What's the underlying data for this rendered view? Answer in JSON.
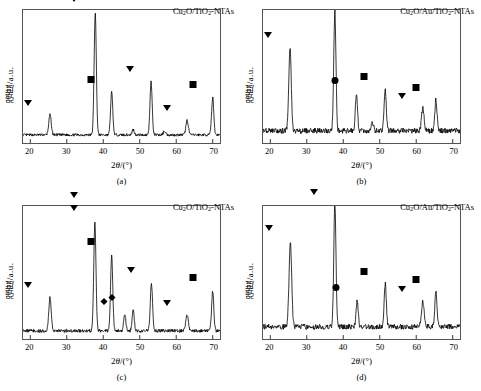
{
  "figure": {
    "axis": {
      "ylabel": "强度/a.u.",
      "xlabel_prefix": "2",
      "xlabel_theta": "θ",
      "xlabel_suffix": "/(°)",
      "xticks": [
        20,
        30,
        40,
        50,
        60,
        70
      ],
      "xlim": [
        18,
        72
      ]
    },
    "panels": [
      {
        "caption": "(a)",
        "label_parts": [
          "Cu",
          "2",
          "O/TiO",
          "2",
          "-NTAs"
        ],
        "label_text": "Cu2O/TiO2-NTAs"
      },
      {
        "caption": "(b)",
        "label_parts": [
          "Cu",
          "2",
          "O/Au/TiO",
          "2",
          "-NTAs"
        ],
        "label_text": "Cu2O/Au/TiO2-NTAs"
      },
      {
        "caption": "(c)",
        "label_parts": [
          "Cu",
          "2",
          "O/TiO",
          "2",
          "-NTAs"
        ],
        "label_text": "Cu2O/TiO2-NTAs"
      },
      {
        "caption": "(d)",
        "label_parts": [
          "Cu",
          "2",
          "O/Au/TiO",
          "2",
          "-NTAs"
        ],
        "label_text": "Cu2O/Au/TiO2-NTAs"
      }
    ]
  },
  "chart_data": [
    {
      "type": "line",
      "panel": "(a)",
      "title": "Cu2O/TiO2-NTAs",
      "xlabel": "2theta/(deg)",
      "ylabel": "Intensity / a.u.",
      "xlim": [
        18,
        72
      ],
      "ylim": [
        0,
        100
      ],
      "grid": false,
      "baseline": 6,
      "noise_amplitude": 2.0,
      "peaks": [
        {
          "x": 25.4,
          "height": 15,
          "width": 0.34,
          "marker": "triangle"
        },
        {
          "x": 37.8,
          "height": 92,
          "width": 0.3,
          "marker": "triangle"
        },
        {
          "x": 42.3,
          "height": 32,
          "width": 0.3,
          "marker": "square"
        },
        {
          "x": 53.1,
          "height": 40,
          "width": 0.3,
          "marker": "triangle"
        },
        {
          "x": 63.0,
          "height": 11,
          "width": 0.34,
          "marker": "triangle"
        },
        {
          "x": 70.0,
          "height": 28,
          "width": 0.3,
          "marker": "square"
        },
        {
          "x": 48.2,
          "height": 4,
          "width": 0.3,
          "marker": null
        },
        {
          "x": 56.8,
          "height": 3,
          "width": 0.3,
          "marker": null
        }
      ]
    },
    {
      "type": "line",
      "panel": "(b)",
      "title": "Cu2O/Au/TiO2-NTAs",
      "xlabel": "2theta/(deg)",
      "ylabel": "Intensity / a.u.",
      "xlim": [
        18,
        72
      ],
      "ylim": [
        0,
        100
      ],
      "grid": false,
      "baseline": 9,
      "noise_amplitude": 4.0,
      "peaks": [
        {
          "x": 25.4,
          "height": 62,
          "width": 0.34,
          "marker": "triangle"
        },
        {
          "x": 37.7,
          "height": 90,
          "width": 0.3,
          "marker": "triangle"
        },
        {
          "x": 43.6,
          "height": 28,
          "width": 0.3,
          "marker": "circle"
        },
        {
          "x": 51.5,
          "height": 31,
          "width": 0.3,
          "marker": "square"
        },
        {
          "x": 61.8,
          "height": 17,
          "width": 0.34,
          "marker": "triangle"
        },
        {
          "x": 65.4,
          "height": 23,
          "width": 0.3,
          "marker": "square"
        },
        {
          "x": 48.0,
          "height": 6,
          "width": 0.3,
          "marker": null
        }
      ]
    },
    {
      "type": "line",
      "panel": "(c)",
      "title": "Cu2O/TiO2-NTAs",
      "xlabel": "2theta/(deg)",
      "ylabel": "Intensity / a.u.",
      "xlim": [
        18,
        72
      ],
      "ylim": [
        0,
        100
      ],
      "grid": false,
      "baseline": 6,
      "noise_amplitude": 2.5,
      "peaks": [
        {
          "x": 25.4,
          "height": 25,
          "width": 0.34,
          "marker": "triangle"
        },
        {
          "x": 37.7,
          "height": 82,
          "width": 0.3,
          "marker": "triangle-double"
        },
        {
          "x": 42.3,
          "height": 57,
          "width": 0.3,
          "marker": "square"
        },
        {
          "x": 45.9,
          "height": 13,
          "width": 0.28,
          "marker": "diamond"
        },
        {
          "x": 48.2,
          "height": 16,
          "width": 0.28,
          "marker": "diamond"
        },
        {
          "x": 53.2,
          "height": 36,
          "width": 0.3,
          "marker": "triangle"
        },
        {
          "x": 63.0,
          "height": 12,
          "width": 0.34,
          "marker": "triangle"
        },
        {
          "x": 70.0,
          "height": 30,
          "width": 0.3,
          "marker": "square"
        }
      ]
    },
    {
      "type": "line",
      "panel": "(d)",
      "title": "Cu2O/Au/TiO2-NTAs",
      "xlabel": "2theta/(deg)",
      "ylabel": "Intensity / a.u.",
      "xlim": [
        18,
        72
      ],
      "ylim": [
        0,
        100
      ],
      "grid": false,
      "baseline": 9,
      "noise_amplitude": 4.0,
      "peaks": [
        {
          "x": 25.5,
          "height": 64,
          "width": 0.36,
          "marker": "triangle"
        },
        {
          "x": 37.7,
          "height": 92,
          "width": 0.3,
          "marker": "triangle"
        },
        {
          "x": 43.8,
          "height": 20,
          "width": 0.28,
          "marker": "circle"
        },
        {
          "x": 51.5,
          "height": 32,
          "width": 0.3,
          "marker": "square"
        },
        {
          "x": 61.8,
          "height": 19,
          "width": 0.36,
          "marker": "triangle"
        },
        {
          "x": 65.4,
          "height": 26,
          "width": 0.3,
          "marker": "square"
        }
      ]
    }
  ]
}
